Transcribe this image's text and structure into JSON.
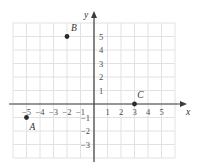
{
  "chart_data": {
    "type": "scatter",
    "title": "",
    "xlabel": "x",
    "ylabel": "y",
    "xlim": [
      -6,
      6
    ],
    "ylim": [
      -4,
      6
    ],
    "grid": true,
    "legend": null,
    "x_ticks": [
      -5,
      -4,
      -3,
      -2,
      -1,
      1,
      2,
      3,
      4,
      5
    ],
    "y_ticks": [
      -3,
      -2,
      -1,
      1,
      2,
      3,
      4,
      5
    ],
    "x_tick_labels": [
      "−5",
      "−4",
      "−3",
      "−2",
      "−1",
      "1",
      "2",
      "3",
      "4",
      "5"
    ],
    "y_tick_labels": [
      "−3",
      "−2",
      "−1",
      "1",
      "2",
      "3",
      "4",
      "5"
    ],
    "points": [
      {
        "label": "A",
        "x": -5,
        "y": -1,
        "label_dx": 6,
        "label_dy": 12
      },
      {
        "label": "B",
        "x": -2,
        "y": 5,
        "label_dx": 7,
        "label_dy": -6
      },
      {
        "label": "C",
        "x": 3,
        "y": 0,
        "label_dx": 6,
        "label_dy": -6
      }
    ]
  },
  "colors": {
    "grid": "#e2e2e4",
    "axis": "#3c3c3c",
    "point": "#2b2b2b",
    "tick_text": "#4a4a4a",
    "label_text": "#333333",
    "background": "#ffffff"
  },
  "axes": {
    "x_axis_label": "x",
    "y_axis_label": "y"
  }
}
